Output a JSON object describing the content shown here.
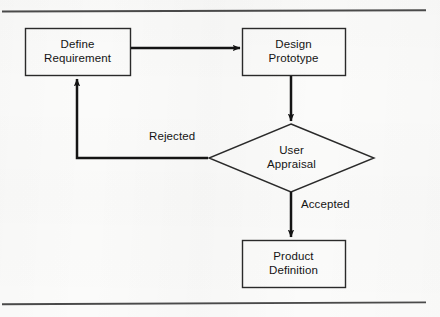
{
  "diagram": {
    "colors": {
      "ink": "#141414",
      "paper": "#fbfbfa",
      "rule": "#444444"
    },
    "frame": {
      "top_rule": "horizontal-rule",
      "bottom_rule": "horizontal-rule"
    },
    "nodes": [
      {
        "id": "define-requirement",
        "shape": "rectangle",
        "label": "Define\nRequirement",
        "x": 25,
        "y": 28,
        "w": 105,
        "h": 47
      },
      {
        "id": "design-prototype",
        "shape": "rectangle",
        "label": "Design\nPrototype",
        "x": 242,
        "y": 28,
        "w": 103,
        "h": 47
      },
      {
        "id": "user-appraisal",
        "shape": "diamond",
        "label": "User\nAppraisal",
        "cx": 291,
        "cy": 158,
        "rx": 83,
        "ry": 34
      },
      {
        "id": "product-definition",
        "shape": "rectangle",
        "label": "Product\nDefinition",
        "x": 242,
        "y": 240,
        "w": 103,
        "h": 47
      }
    ],
    "edges": [
      {
        "id": "define-to-design",
        "from": "define-requirement",
        "to": "design-prototype",
        "label": "",
        "arrow": "right"
      },
      {
        "id": "design-to-appraisal",
        "from": "design-prototype",
        "to": "user-appraisal",
        "label": "",
        "arrow": "down"
      },
      {
        "id": "appraisal-rejected-to-define",
        "from": "user-appraisal",
        "to": "define-requirement",
        "label": "Rejected",
        "arrow": "up"
      },
      {
        "id": "appraisal-accepted-to-product",
        "from": "user-appraisal",
        "to": "product-definition",
        "label": "Accepted",
        "arrow": "down"
      }
    ]
  }
}
